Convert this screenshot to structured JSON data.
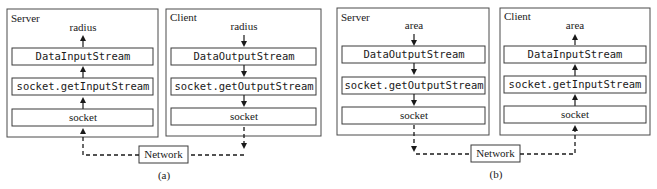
{
  "diagrams": [
    {
      "caption": "(a)",
      "network_label": "Network",
      "server": {
        "title": "Server",
        "value_label": "radius",
        "direction": "up",
        "stream_box": "DataInputStream",
        "socket_stream_box": "socket.getInputStream",
        "socket_box": "socket"
      },
      "client": {
        "title": "Client",
        "value_label": "radius",
        "direction": "down",
        "stream_box": "DataOutputStream",
        "socket_stream_box": "socket.getOutputStream",
        "socket_box": "socket"
      },
      "network_flow": "client-to-server"
    },
    {
      "caption": "(b)",
      "network_label": "Network",
      "server": {
        "title": "Server",
        "value_label": "area",
        "direction": "down",
        "stream_box": "DataOutputStream",
        "socket_stream_box": "socket.getOutputStream",
        "socket_box": "socket"
      },
      "client": {
        "title": "Client",
        "value_label": "area",
        "direction": "up",
        "stream_box": "DataInputStream",
        "socket_stream_box": "socket.getInputStream",
        "socket_box": "socket"
      },
      "network_flow": "server-to-client"
    }
  ]
}
